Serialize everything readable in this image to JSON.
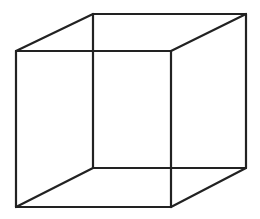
{
  "diagram": {
    "type": "necker-cube",
    "stroke_color": "#222222",
    "background": "#ffffff",
    "vertices": {
      "front_top_left": [
        16,
        51
      ],
      "front_top_right": [
        171,
        51
      ],
      "front_bottom_left": [
        16,
        207
      ],
      "front_bottom_right": [
        171,
        207
      ],
      "back_top_left": [
        93,
        14
      ],
      "back_top_right": [
        246,
        14
      ],
      "back_bottom_left": [
        93,
        168
      ],
      "back_bottom_right": [
        246,
        168
      ]
    },
    "edges": [
      [
        "front_top_left",
        "front_top_right"
      ],
      [
        "front_top_right",
        "front_bottom_right"
      ],
      [
        "front_bottom_right",
        "front_bottom_left"
      ],
      [
        "front_bottom_left",
        "front_top_left"
      ],
      [
        "back_top_left",
        "back_top_right"
      ],
      [
        "back_top_right",
        "back_bottom_right"
      ],
      [
        "back_bottom_right",
        "back_bottom_left"
      ],
      [
        "back_bottom_left",
        "back_top_left"
      ],
      [
        "front_top_left",
        "back_top_left"
      ],
      [
        "front_top_right",
        "back_top_right"
      ],
      [
        "front_bottom_left",
        "back_bottom_left"
      ],
      [
        "front_bottom_right",
        "back_bottom_right"
      ]
    ]
  }
}
